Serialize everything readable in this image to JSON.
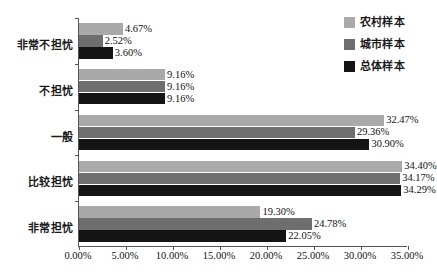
{
  "chart_data": {
    "type": "bar",
    "orientation": "horizontal",
    "title": "",
    "xlabel": "",
    "ylabel": "",
    "xlim": [
      0,
      35
    ],
    "xtick_labels": [
      "0.00%",
      "5.00%",
      "10.00%",
      "15.00%",
      "20.00%",
      "25.00%",
      "30.00%",
      "35.00%"
    ],
    "xtick_values": [
      0,
      5,
      10,
      15,
      20,
      25,
      30,
      35
    ],
    "grid": false,
    "legend_position": "top-right",
    "categories": [
      "非常不担忧",
      "不担忧",
      "一般",
      "比较担忧",
      "非常担忧"
    ],
    "series": [
      {
        "name": "农村样本",
        "color": "#a9a9a9",
        "values": [
          4.67,
          9.16,
          32.47,
          34.4,
          19.3
        ],
        "labels": [
          "4.67%",
          "9.16%",
          "32.47%",
          "34.40%",
          "19.30%"
        ]
      },
      {
        "name": "城市样本",
        "color": "#6e6e6e",
        "values": [
          2.52,
          9.16,
          29.36,
          34.17,
          24.78
        ],
        "labels": [
          "2.52%",
          "9.16%",
          "29.36%",
          "34.17%",
          "24.78%"
        ]
      },
      {
        "name": "总体样本",
        "color": "#141414",
        "values": [
          3.6,
          9.16,
          30.9,
          34.29,
          22.05
        ],
        "labels": [
          "3.60%",
          "9.16%",
          "30.90%",
          "34.29%",
          "22.05%"
        ]
      }
    ]
  },
  "axis": {
    "line_color": "#555555"
  }
}
